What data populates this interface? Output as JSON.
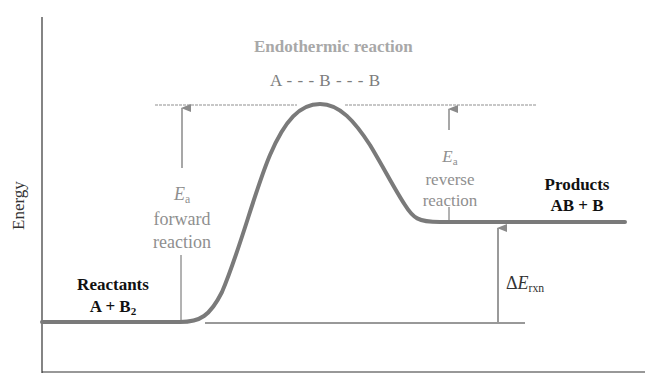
{
  "diagram": {
    "title": "Endothermic reaction",
    "transition_state": "A - - - B - - - B",
    "y_axis_label": "Energy",
    "reactants": {
      "label": "Reactants",
      "formula_main": "A + B",
      "formula_sub": "2"
    },
    "products": {
      "label": "Products",
      "formula": "AB + B"
    },
    "ea_forward": {
      "symbol": "E",
      "subscript": "a",
      "line1": "forward",
      "line2": "reaction"
    },
    "ea_reverse": {
      "symbol": "E",
      "subscript": "a",
      "line1": "reverse",
      "line2": "reaction"
    },
    "delta_e": {
      "prefix": "Δ",
      "symbol": "E",
      "subscript": "rxn"
    },
    "colors": {
      "curve": "#7a7a7a",
      "axis": "#333333",
      "arrow": "#8a8a8a",
      "title": "#a8a8a8",
      "dashed_line": "#b5b5b5"
    },
    "levels": {
      "reactants_y": 322,
      "products_y": 222,
      "transition_state_y": 104
    }
  }
}
